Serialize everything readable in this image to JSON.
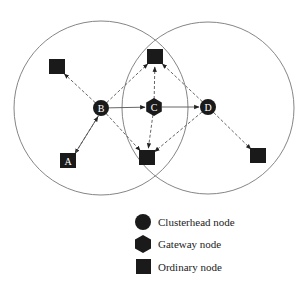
{
  "diagram": {
    "type": "cluster-network",
    "colors": {
      "node_fill": "#1a1a1a",
      "range_circle": "#777777",
      "edge": "#555555",
      "background": "#ffffff"
    },
    "clusters": [
      {
        "name": "cluster-B",
        "cx": 101,
        "cy": 108,
        "r": 87
      },
      {
        "name": "cluster-D",
        "cx": 208,
        "cy": 108,
        "r": 86
      }
    ],
    "nodes": {
      "B": {
        "label": "B",
        "kind": "clusterhead",
        "x": 101,
        "y": 108
      },
      "C": {
        "label": "C",
        "kind": "gateway",
        "x": 154,
        "y": 107
      },
      "D": {
        "label": "D",
        "kind": "clusterhead",
        "x": 208,
        "y": 107
      },
      "A": {
        "label": "A",
        "kind": "ordinary",
        "x": 68,
        "y": 161
      },
      "O1": {
        "label": "",
        "kind": "ordinary",
        "x": 57,
        "y": 67
      },
      "O2": {
        "label": "",
        "kind": "ordinary",
        "x": 155,
        "y": 57
      },
      "O3": {
        "label": "",
        "kind": "ordinary",
        "x": 147,
        "y": 158
      },
      "O4": {
        "label": "",
        "kind": "ordinary",
        "x": 258,
        "y": 156
      }
    },
    "edges": [
      {
        "from": "B",
        "to": "O1",
        "style": "dashed"
      },
      {
        "from": "B",
        "to": "A",
        "style": "dashed"
      },
      {
        "from": "A",
        "to": "B",
        "style": "solid"
      },
      {
        "from": "B",
        "to": "O2",
        "style": "dashed"
      },
      {
        "from": "B",
        "to": "O3",
        "style": "dashed"
      },
      {
        "from": "B",
        "to": "C",
        "style": "solid"
      },
      {
        "from": "C",
        "to": "D",
        "style": "solid"
      },
      {
        "from": "C",
        "to": "O2",
        "style": "dashed"
      },
      {
        "from": "C",
        "to": "O3",
        "style": "dashed"
      },
      {
        "from": "D",
        "to": "O2",
        "style": "dashed"
      },
      {
        "from": "D",
        "to": "O3",
        "style": "dashed"
      },
      {
        "from": "D",
        "to": "O4",
        "style": "dashed"
      }
    ]
  },
  "legend": {
    "items": [
      {
        "shape": "circle",
        "label": "Clusterhead node"
      },
      {
        "shape": "hexagon",
        "label": "Gateway node"
      },
      {
        "shape": "square",
        "label": "Ordinary node"
      }
    ]
  }
}
